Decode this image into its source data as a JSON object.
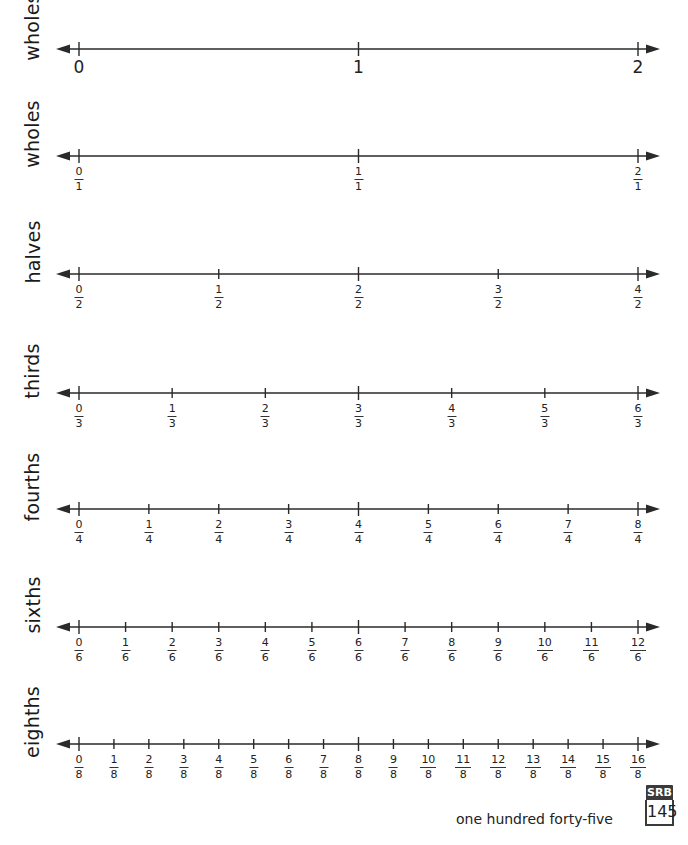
{
  "rows": [
    {
      "label": "wholes",
      "type": "whole",
      "line_y": 49,
      "ticks": [
        "0",
        "1",
        "2"
      ]
    },
    {
      "label": "wholes",
      "type": "fraction",
      "line_y": 156,
      "denominator": "1",
      "numerators": [
        "0",
        "1",
        "2"
      ]
    },
    {
      "label": "halves",
      "type": "fraction",
      "line_y": 274,
      "denominator": "2",
      "numerators": [
        "0",
        "1",
        "2",
        "3",
        "4"
      ]
    },
    {
      "label": "thirds",
      "type": "fraction",
      "line_y": 393,
      "denominator": "3",
      "numerators": [
        "0",
        "1",
        "2",
        "3",
        "4",
        "5",
        "6"
      ]
    },
    {
      "label": "fourths",
      "type": "fraction",
      "line_y": 509,
      "denominator": "4",
      "numerators": [
        "0",
        "1",
        "2",
        "3",
        "4",
        "5",
        "6",
        "7",
        "8"
      ]
    },
    {
      "label": "sixths",
      "type": "fraction",
      "line_y": 627,
      "denominator": "6",
      "numerators": [
        "0",
        "1",
        "2",
        "3",
        "4",
        "5",
        "6",
        "7",
        "8",
        "9",
        "10",
        "11",
        "12"
      ]
    },
    {
      "label": "eighths",
      "type": "fraction",
      "line_y": 744,
      "denominator": "8",
      "numerators": [
        "0",
        "1",
        "2",
        "3",
        "4",
        "5",
        "6",
        "7",
        "8",
        "9",
        "10",
        "11",
        "12",
        "13",
        "14",
        "15",
        "16"
      ]
    }
  ],
  "axis": {
    "x_start": 79,
    "x_end": 638,
    "arrow_left": 56,
    "arrow_right": 660,
    "color": "#2a2a2a"
  },
  "footer": {
    "page_words": "one hundred forty-five",
    "badge_label": "SRB",
    "page_number": "145"
  }
}
